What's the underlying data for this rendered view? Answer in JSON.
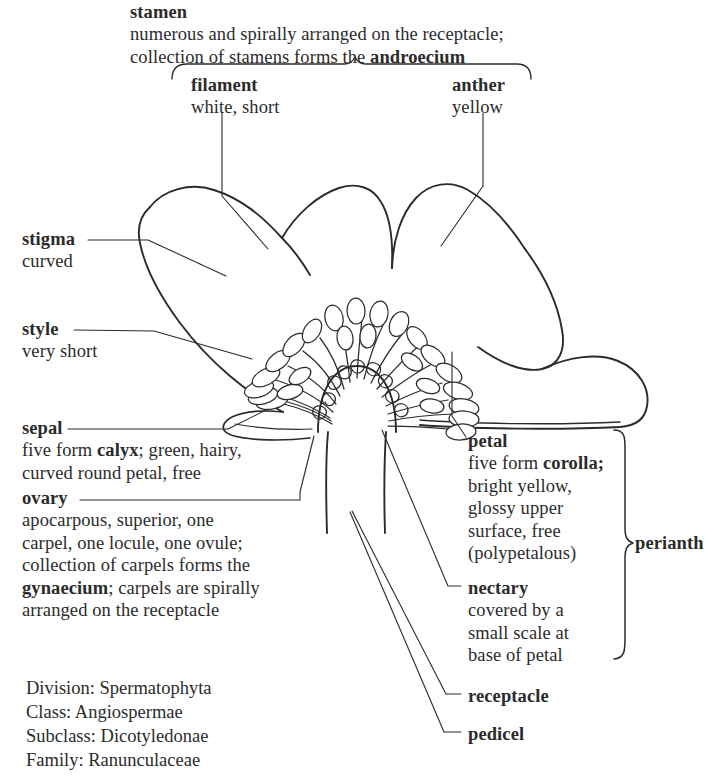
{
  "figure": {
    "ink_color": "#2b2b2b",
    "background_color": "#ffffff"
  },
  "labels": {
    "stamen": {
      "term": "stamen",
      "lines": [
        "numerous and spirally arranged on the receptacle;",
        "collection of stamens forms the "
      ],
      "emphasis": "androecium"
    },
    "filament": {
      "term": "filament",
      "detail": "white, short"
    },
    "anther": {
      "term": "anther",
      "detail": "yellow"
    },
    "stigma": {
      "term": "stigma",
      "detail": "curved"
    },
    "style": {
      "term": "style",
      "detail": "very short"
    },
    "sepal": {
      "term": "sepal",
      "line1_a": "five form ",
      "line1_bold": "calyx",
      "line1_b": "; green, hairy,",
      "line2": "curved round petal, free"
    },
    "ovary": {
      "term": "ovary",
      "line1": "apocarpous, superior, one",
      "line2": "carpel, one locule, one ovule;",
      "line3": "collection of carpels forms the",
      "line4_bold": "gynaecium",
      "line4_rest": "; carpels are spirally",
      "line5": "arranged on the receptacle"
    },
    "petal": {
      "term": "petal",
      "line1_a": "five form ",
      "line1_bold": "corolla;",
      "line2": "bright yellow,",
      "line3": "glossy upper",
      "line4": "surface, free",
      "line5": "(polypetalous)"
    },
    "nectary": {
      "term": "nectary",
      "line1": "covered by a",
      "line2": "small scale at",
      "line3": "base of petal"
    },
    "perianth": {
      "term": "perianth"
    },
    "receptacle": {
      "term": "receptacle"
    },
    "pedicel": {
      "term": "pedicel"
    }
  },
  "taxonomy": {
    "lines": [
      "Division: Spermatophyta",
      "Class: Angiospermae",
      "Subclass: Dicotyledonae",
      "Family: Ranunculaceae"
    ]
  }
}
